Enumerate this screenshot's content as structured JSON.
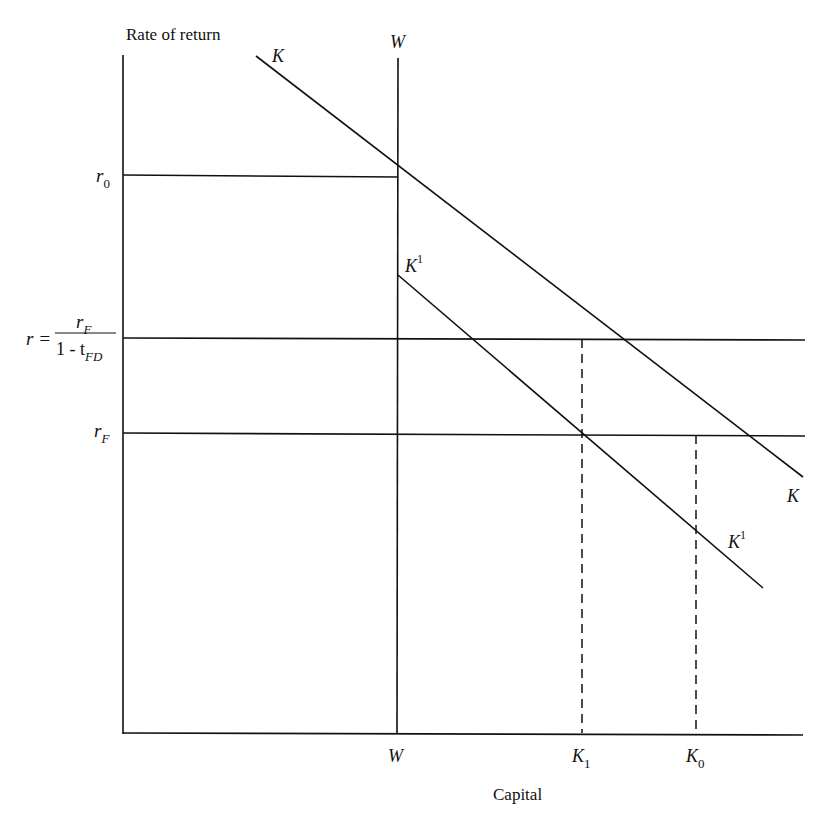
{
  "figure": {
    "y_axis_title": "Rate of return",
    "x_axis_title": "Capital",
    "curves": {
      "K": {
        "label": "K",
        "start": [
          256,
          56
        ],
        "end": [
          803,
          477
        ]
      },
      "K1": {
        "label": "K",
        "sup": "1",
        "start": [
          398,
          275
        ],
        "end": [
          763,
          588
        ]
      },
      "W": {
        "label": "W",
        "x": 398
      }
    },
    "y_levels": {
      "r0": {
        "base": "r",
        "sub": "0",
        "y": 175
      },
      "r": {
        "lhs": "r =",
        "num_base": "r",
        "num_sub": "F",
        "den_prefix": "1 - t",
        "den_sub": "FD",
        "y": 339
      },
      "rF": {
        "base": "r",
        "sub": "F",
        "y": 434
      }
    },
    "x_ticks": {
      "W": {
        "label": "W"
      },
      "K1": {
        "base": "K",
        "sub": "1",
        "x": 582
      },
      "K0": {
        "base": "K",
        "sub": "0",
        "x": 696
      }
    },
    "line_color": "#111111",
    "background": "#ffffff"
  }
}
